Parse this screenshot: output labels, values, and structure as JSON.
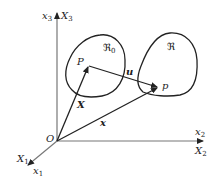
{
  "diagram": {
    "type": "continuum-mechanics-configuration",
    "colors": {
      "stroke": "#222222",
      "axis": "#555555",
      "background": "#ffffff"
    },
    "axes": {
      "vertical": {
        "lower": "x",
        "lower_sub": "3",
        "upper": "X",
        "upper_sub": "3"
      },
      "horizontal": {
        "upper": "x",
        "upper_sub": "2",
        "lower": "X",
        "lower_sub": "2"
      },
      "oblique": {
        "upper": "X",
        "upper_sub": "1",
        "lower": "x",
        "lower_sub": "1"
      }
    },
    "origin_label": "O",
    "regions": {
      "reference": {
        "symbol": "ℜ",
        "sub": "0"
      },
      "current": {
        "symbol": "ℜ"
      }
    },
    "points": {
      "reference_point": "P",
      "current_point": "p"
    },
    "vectors": {
      "reference_position": "X",
      "current_position": "x",
      "displacement": "u"
    }
  }
}
